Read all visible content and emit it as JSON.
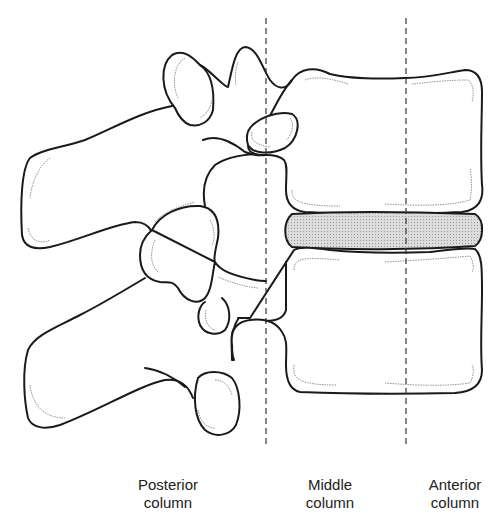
{
  "diagram": {
    "colors": {
      "outline": "#1a1a1a",
      "divider": "#333333",
      "disc_fill": "#cfcfcf",
      "background": "#ffffff"
    },
    "dividers": [
      {
        "name": "posterior-middle-boundary",
        "x": 266
      },
      {
        "name": "middle-anterior-boundary",
        "x": 406
      }
    ],
    "labels": [
      {
        "id": "posterior",
        "line1": "Posterior",
        "line2": "column",
        "x": 168
      },
      {
        "id": "middle",
        "line1": "Middle",
        "line2": "column",
        "x": 330
      },
      {
        "id": "anterior",
        "line1": "Anterior",
        "line2": "column",
        "x": 455
      }
    ]
  }
}
